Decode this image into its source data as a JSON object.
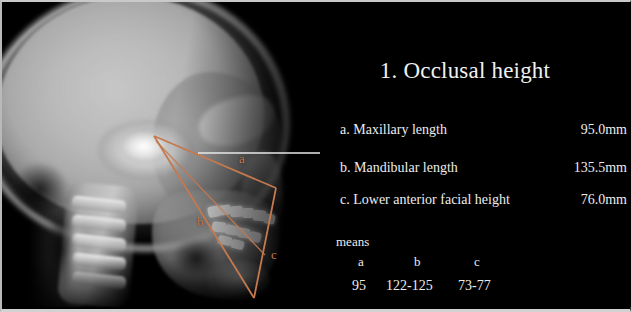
{
  "slide": {
    "title": "1. Occlusal height",
    "measurements": [
      {
        "label": "a. Maxillary length",
        "value": "95.0mm"
      },
      {
        "label": "b. Mandibular length",
        "value": "135.5mm"
      },
      {
        "label": "c. Lower anterior facial height",
        "value": "76.0mm"
      }
    ],
    "means": {
      "caption": "means",
      "headers": [
        "a",
        "b",
        "c"
      ],
      "values": [
        "95",
        "122-125",
        "73-77"
      ]
    }
  },
  "xray": {
    "type": "lateral-cephalometric-radiograph",
    "annotation_color": "#c4794f",
    "reference_line_color": "#e8e8e8",
    "labels": [
      {
        "text": "a",
        "x": 240,
        "y": 156
      },
      {
        "text": "b",
        "x": 196,
        "y": 219
      },
      {
        "text": "c",
        "x": 270,
        "y": 251
      }
    ]
  },
  "colors": {
    "background": "#000000",
    "text": "#ededed",
    "accent": "#c4794f",
    "border": "#cccccc"
  }
}
